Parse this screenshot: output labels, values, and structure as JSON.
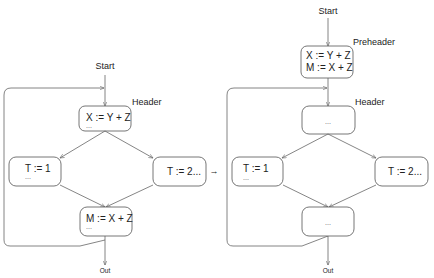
{
  "caption_fragment": "...",
  "transition_arrow": "→",
  "before": {
    "start_label": "Start",
    "out_label": "Out",
    "header_label": "Header",
    "nodes": {
      "header": {
        "line1": "X := Y + Z",
        "extra": "..."
      },
      "left": {
        "line1": "T := 1",
        "extra": "..."
      },
      "right": {
        "line1": "T := 2..."
      },
      "merge": {
        "line1": "M := X + Z",
        "extra": "..."
      }
    }
  },
  "after": {
    "start_label": "Start",
    "out_label": "Out",
    "preheader_label": "Preheader",
    "header_label": "Header",
    "nodes": {
      "preheader": {
        "line1": "X := Y + Z",
        "line2": "M := X + Z"
      },
      "header": {
        "line1": "..."
      },
      "left": {
        "line1": "T := 1",
        "extra": "..."
      },
      "right": {
        "line1": "T := 2..."
      },
      "merge": {
        "line1": "..."
      }
    }
  }
}
